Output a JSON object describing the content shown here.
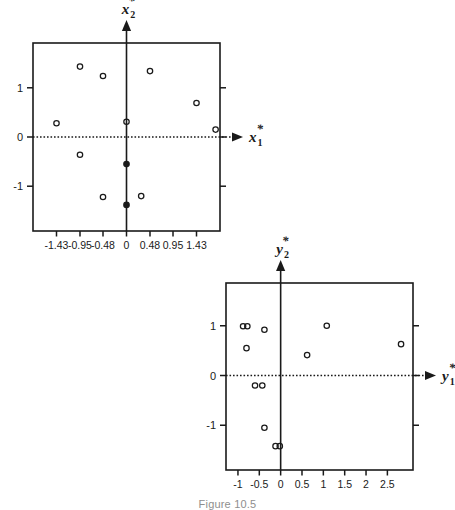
{
  "figure": {
    "caption": "Figure 10.5",
    "background_color": "#ffffff",
    "ink_color": "#1a1a1a"
  },
  "chart_data": [
    {
      "type": "scatter",
      "title": "",
      "id": "x-star-scatter",
      "xlabel": "x*1",
      "ylabel": "x*2",
      "xlabel_base": "x",
      "xlabel_sub": "1",
      "ylabel_base": "x",
      "ylabel_sub": "2",
      "star": "*",
      "xlim": [
        -1.91,
        1.91
      ],
      "ylim": [
        -1.91,
        1.91
      ],
      "xticks": [
        -1.43,
        -0.95,
        -0.48,
        0,
        0.48,
        0.95,
        1.43
      ],
      "xticklabels": [
        "-1.43",
        "-0.95",
        "-0.48",
        "0",
        "0.48",
        "0.95",
        "1.43"
      ],
      "yticks": [
        -1,
        0,
        1
      ],
      "yticklabels": [
        "-1",
        "0",
        "1"
      ],
      "grid": false,
      "legend": "none",
      "axis_style": "dotted-horizontal-arrow",
      "points": [
        {
          "x": -0.95,
          "y": 1.43,
          "filled": false
        },
        {
          "x": -0.48,
          "y": 1.24,
          "filled": false
        },
        {
          "x": 0.48,
          "y": 1.34,
          "filled": false
        },
        {
          "x": -1.43,
          "y": 0.28,
          "filled": false
        },
        {
          "x": 1.43,
          "y": 0.69,
          "filled": false
        },
        {
          "x": 0.0,
          "y": 0.31,
          "filled": false
        },
        {
          "x": 1.82,
          "y": 0.15,
          "filled": false
        },
        {
          "x": -0.95,
          "y": -0.36,
          "filled": false
        },
        {
          "x": 0.0,
          "y": -0.55,
          "filled": true
        },
        {
          "x": -0.48,
          "y": -1.22,
          "filled": false
        },
        {
          "x": 0.3,
          "y": -1.2,
          "filled": false
        },
        {
          "x": 0.0,
          "y": -1.38,
          "filled": true
        }
      ]
    },
    {
      "type": "scatter",
      "title": "",
      "id": "y-star-scatter",
      "xlabel": "y*1",
      "ylabel": "y*2",
      "xlabel_base": "y",
      "xlabel_sub": "1",
      "ylabel_base": "y",
      "ylabel_sub": "2",
      "star": "*",
      "xlim": [
        -1.28,
        3.1
      ],
      "ylim": [
        -1.9,
        1.86
      ],
      "xticks": [
        -1,
        -0.5,
        0,
        0.5,
        1,
        1.5,
        2,
        2.5
      ],
      "xticklabels": [
        "-1",
        "-0.5",
        "0",
        "0.5",
        "1",
        "1.5",
        "2",
        "2.5"
      ],
      "yticks": [
        -1,
        0,
        1
      ],
      "yticklabels": [
        "-1",
        "0",
        "1"
      ],
      "grid": false,
      "legend": "none",
      "axis_style": "dotted-horizontal-arrow",
      "points": [
        {
          "x": -0.88,
          "y": 0.99,
          "filled": false
        },
        {
          "x": -0.78,
          "y": 0.99,
          "filled": false
        },
        {
          "x": -0.38,
          "y": 0.92,
          "filled": false
        },
        {
          "x": 1.08,
          "y": 1.0,
          "filled": false
        },
        {
          "x": -0.8,
          "y": 0.55,
          "filled": false
        },
        {
          "x": 2.82,
          "y": 0.63,
          "filled": false
        },
        {
          "x": 0.62,
          "y": 0.41,
          "filled": false
        },
        {
          "x": -0.6,
          "y": -0.2,
          "filled": false
        },
        {
          "x": -0.43,
          "y": -0.2,
          "filled": false
        },
        {
          "x": -0.38,
          "y": -1.05,
          "filled": false
        },
        {
          "x": -0.12,
          "y": -1.42,
          "filled": false
        },
        {
          "x": -0.02,
          "y": -1.42,
          "filled": false
        }
      ]
    }
  ]
}
